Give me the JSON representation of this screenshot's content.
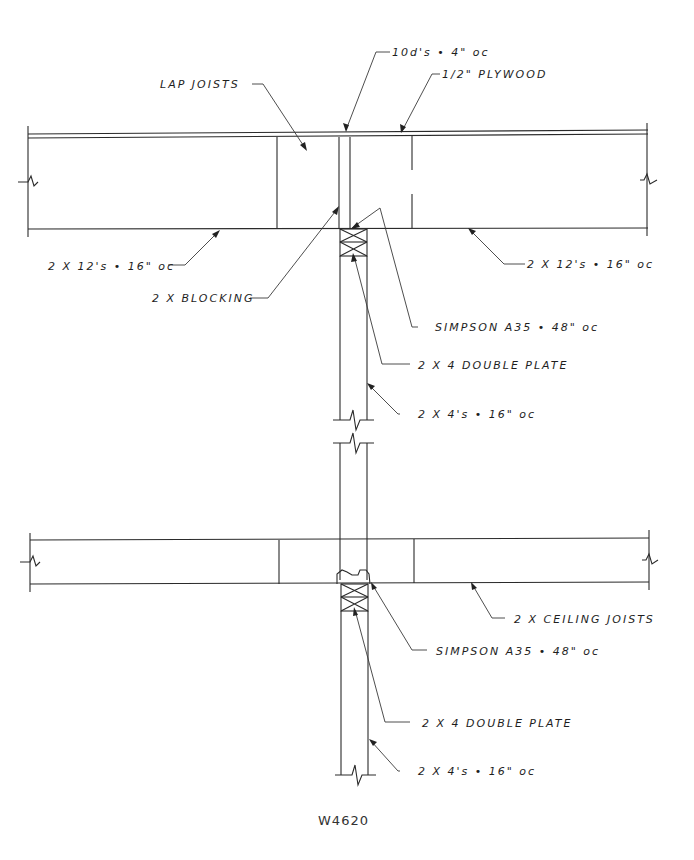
{
  "drawing": {
    "id": "W4620",
    "colors": {
      "line": "#2a2a2a",
      "text": "#1e1e1e",
      "background": "#ffffff"
    },
    "upper_floor": {
      "labels": {
        "nails": "10d's • 4\" oc",
        "plywood": "1/2\" PLYWOOD",
        "lap_joists": "LAP JOISTS",
        "joists_left": "2 X 12's • 16\" oc",
        "joists_right": "2 X 12's • 16\" oc",
        "blocking": "2 X BLOCKING",
        "clip": "SIMPSON A35 • 48\" oc",
        "plate": "2 X 4 DOUBLE PLATE",
        "studs": "2 X 4's • 16\" oc"
      }
    },
    "ceiling": {
      "labels": {
        "ceiling_joists": "2 X CEILING JOISTS",
        "clip": "SIMPSON A35 • 48\" oc",
        "plate": "2 X 4 DOUBLE PLATE",
        "studs": "2 X 4's • 16\" oc"
      }
    }
  }
}
